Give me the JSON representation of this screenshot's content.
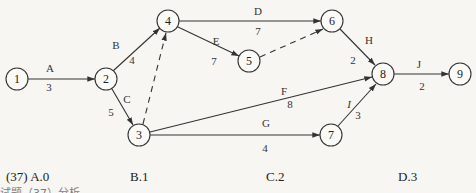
{
  "diagram": {
    "type": "activity-on-arrow network",
    "nodes": [
      {
        "id": "1",
        "x": 17,
        "y": 79
      },
      {
        "id": "2",
        "x": 106,
        "y": 79
      },
      {
        "id": "3",
        "x": 139,
        "y": 135
      },
      {
        "id": "4",
        "x": 168,
        "y": 21
      },
      {
        "id": "5",
        "x": 249,
        "y": 61
      },
      {
        "id": "6",
        "x": 332,
        "y": 21
      },
      {
        "id": "7",
        "x": 331,
        "y": 135
      },
      {
        "id": "8",
        "x": 383,
        "y": 74
      },
      {
        "id": "9",
        "x": 460,
        "y": 74
      }
    ],
    "edges": [
      {
        "from": "1",
        "to": "2",
        "activity": "A",
        "duration": "3",
        "dashed": false
      },
      {
        "from": "2",
        "to": "4",
        "activity": "B",
        "duration": "4",
        "dashed": false
      },
      {
        "from": "2",
        "to": "3",
        "activity": "C",
        "duration": "5",
        "dashed": false
      },
      {
        "from": "3",
        "to": "4",
        "activity": "",
        "duration": "",
        "dashed": true
      },
      {
        "from": "4",
        "to": "6",
        "activity": "D",
        "duration": "7",
        "dashed": false
      },
      {
        "from": "4",
        "to": "5",
        "activity": "E",
        "duration": "7",
        "dashed": false
      },
      {
        "from": "5",
        "to": "6",
        "activity": "",
        "duration": "",
        "dashed": true
      },
      {
        "from": "3",
        "to": "8",
        "activity": "F",
        "duration": "8",
        "dashed": false
      },
      {
        "from": "3",
        "to": "7",
        "activity": "G",
        "duration": "4",
        "dashed": false
      },
      {
        "from": "6",
        "to": "8",
        "activity": "H",
        "duration": "2",
        "dashed": false
      },
      {
        "from": "7",
        "to": "8",
        "activity": "I",
        "duration": "3",
        "dashed": false
      },
      {
        "from": "8",
        "to": "9",
        "activity": "J",
        "duration": "2",
        "dashed": false
      }
    ]
  },
  "question": {
    "number": "(37)",
    "options": [
      {
        "key": "A",
        "text": "A.0"
      },
      {
        "key": "B",
        "text": "B.1"
      },
      {
        "key": "C",
        "text": "C.2"
      },
      {
        "key": "D",
        "text": "D.3"
      }
    ]
  },
  "partial_line": "试题（37）分析"
}
